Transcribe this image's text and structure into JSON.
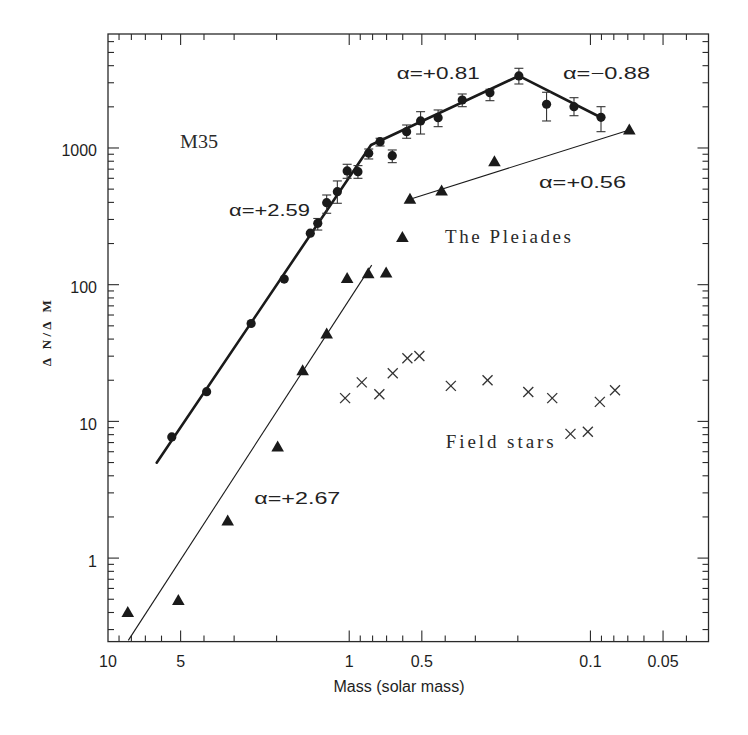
{
  "chart_data": {
    "type": "scatter",
    "title": "",
    "xlabel": "Mass (solar mass)",
    "ylabel": "Δ N/Δ M",
    "xscale": "log",
    "yscale": "log",
    "x_reversed": true,
    "xlim": [
      10,
      0.0324
    ],
    "ylim": [
      0.245,
      6820
    ],
    "grid": false,
    "legend": "none",
    "x_ticks": [
      {
        "value": 10,
        "label": "10"
      },
      {
        "value": 5,
        "label": "5"
      },
      {
        "value": 1,
        "label": "1"
      },
      {
        "value": 0.5,
        "label": "0.5"
      },
      {
        "value": 0.1,
        "label": "0.1"
      },
      {
        "value": 0.05,
        "label": "0.05"
      }
    ],
    "y_ticks": [
      {
        "value": 1,
        "label": "1"
      },
      {
        "value": 10,
        "label": "10"
      },
      {
        "value": 100,
        "label": "100"
      },
      {
        "value": 1000,
        "label": "1000"
      }
    ],
    "series": [
      {
        "name": "M35",
        "marker": "circle",
        "x": [
          5.44,
          3.9,
          2.55,
          1.86,
          1.45,
          1.35,
          1.24,
          1.12,
          1.02,
          0.92,
          0.83,
          0.745,
          0.663,
          0.578,
          0.506,
          0.428,
          0.34,
          0.261,
          0.198,
          0.152,
          0.117,
          0.0904
        ],
        "y": [
          7.7,
          16.5,
          52,
          110,
          238,
          281,
          398,
          479,
          679,
          671,
          915,
          1112,
          878,
          1316,
          1577,
          1666,
          2244,
          2540,
          3366,
          2089,
          2005,
          1677
        ],
        "yerr": [
          null,
          null,
          null,
          null,
          null,
          [
            251,
            305
          ],
          [
            333,
            453
          ],
          [
            394,
            574
          ],
          [
            600,
            760
          ],
          [
            600,
            743
          ],
          [
            831,
            983
          ],
          [
            1034,
            1178
          ],
          [
            781,
            967
          ],
          [
            1178,
            1473
          ],
          [
            1265,
            1843
          ],
          [
            1432,
            1897
          ],
          [
            2005,
            2483
          ],
          [
            2218,
            2688
          ],
          [
            2938,
            3828
          ],
          [
            1576,
            2556
          ],
          [
            1722,
            2333
          ],
          [
            1316,
            2005
          ]
        ]
      },
      {
        "name": "The Pleiades",
        "marker": "triangle",
        "x": [
          8.28,
          5.11,
          3.19,
          1.98,
          1.56,
          1.24,
          1.02,
          0.834,
          0.703,
          0.602,
          0.56,
          0.414,
          0.25,
          0.069
        ],
        "y": [
          0.4,
          0.49,
          1.87,
          6.5,
          23.5,
          43.5,
          111,
          120,
          122,
          221,
          421,
          485,
          794,
          1355
        ]
      },
      {
        "name": "Field stars",
        "marker": "x",
        "x": [
          1.04,
          0.887,
          0.75,
          0.66,
          0.574,
          0.512,
          0.379,
          0.267,
          0.181,
          0.144,
          0.121,
          0.1025,
          0.0914,
          0.0791
        ],
        "y": [
          14.8,
          19.3,
          15.8,
          22.5,
          29,
          30.1,
          18.2,
          20,
          16.4,
          14.8,
          8.1,
          8.4,
          13.9,
          16.9
        ]
      }
    ],
    "fits": [
      {
        "series": "M35",
        "weight": "thick",
        "alphas": [
          "+2.59",
          "+0.81",
          "-0.88"
        ],
        "points": [
          [
            6.28,
            4.99
          ],
          [
            0.812,
            1052
          ],
          [
            0.198,
            3366
          ],
          [
            0.0904,
            1672
          ]
        ]
      },
      {
        "series": "The Pleiades",
        "weight": "thin",
        "alphas": [
          "+2.67"
        ],
        "points": [
          [
            8.24,
            0.25
          ],
          [
            0.807,
            139
          ]
        ]
      },
      {
        "series": "The Pleiades",
        "weight": "thin",
        "alphas": [
          "+0.56"
        ],
        "points": [
          [
            0.56,
            421
          ],
          [
            0.069,
            1355
          ]
        ]
      }
    ],
    "annotations": [
      {
        "text": "M35",
        "x": 5.0,
        "y": 1000
      },
      {
        "text": "α=+2.59",
        "x": 3.15,
        "y": 315
      },
      {
        "text": "α=+0.81",
        "x": 0.635,
        "y": 3250
      },
      {
        "text": "α=−0.88",
        "x": 0.13,
        "y": 3250
      },
      {
        "text": "α=+0.56",
        "x": 0.163,
        "y": 519
      },
      {
        "text": "The Pleiades",
        "x": 0.401,
        "y": 205
      },
      {
        "text": "Field stars",
        "x": 0.398,
        "y": 6.55
      },
      {
        "text": "α=+2.67",
        "x": 2.47,
        "y": 2.55
      }
    ]
  }
}
